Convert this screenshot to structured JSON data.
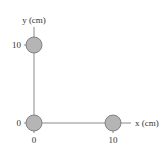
{
  "diagram": {
    "axes": {
      "x_label": "x (cm)",
      "y_label": "y (cm)",
      "x_ticks": [
        "0",
        "10"
      ],
      "y_ticks": [
        "0",
        "10"
      ]
    },
    "masses": [
      {
        "name": "mass-origin",
        "x": 0,
        "y": 0
      },
      {
        "name": "mass-x10",
        "x": 10,
        "y": 0
      },
      {
        "name": "mass-y10",
        "x": 0,
        "y": 10
      }
    ],
    "colors": {
      "mass_fill": "#b5b5b5",
      "mass_stroke": "#6e6e6e",
      "axis": "#8a8a8a",
      "text": "#333333"
    }
  }
}
